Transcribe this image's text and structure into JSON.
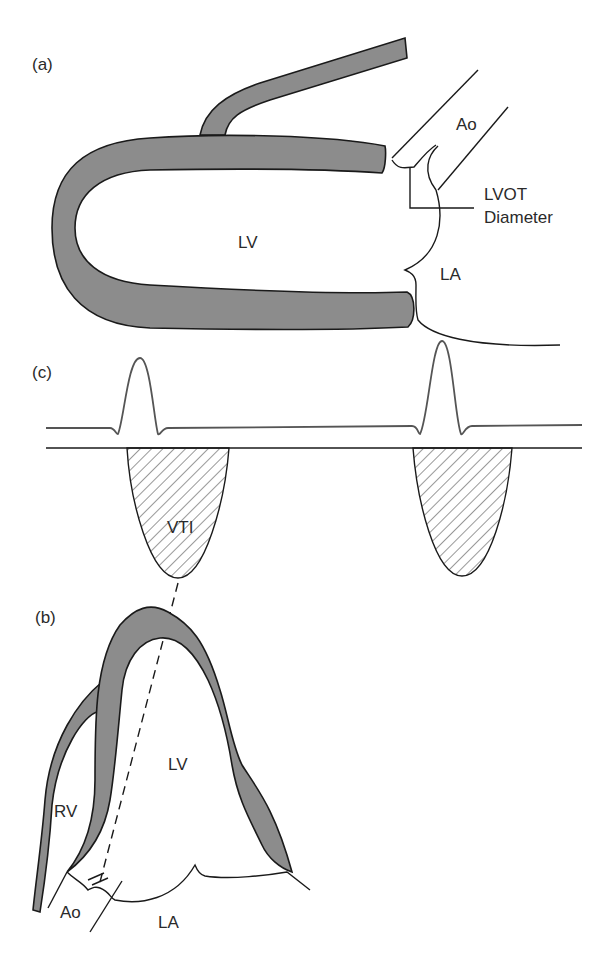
{
  "figure": {
    "panels": [
      {
        "id": "a",
        "label": "(a)",
        "view": "parasternal long axis"
      },
      {
        "id": "c",
        "label": "(c)",
        "view": "ECG and pulsed-wave Doppler"
      },
      {
        "id": "b",
        "label": "(b)",
        "view": "apical long axis"
      }
    ],
    "panel_a": {
      "label": "(a)",
      "lv": "LV",
      "ao": "Ao",
      "la": "LA",
      "lvot_line1": "LVOT",
      "lvot_line2": "Diameter"
    },
    "panel_c": {
      "label": "(c)",
      "vti": "VTI"
    },
    "panel_b": {
      "label": "(b)",
      "lv": "LV",
      "rv": "RV",
      "ao": "Ao",
      "la": "LA"
    },
    "colors": {
      "wall_fill": "#8c8c8c",
      "outline": "#1a1a1a",
      "ecg": "#555555",
      "background": "#ffffff"
    }
  }
}
